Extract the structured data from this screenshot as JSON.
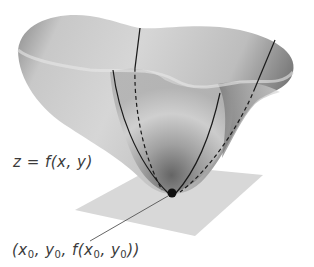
{
  "figure": {
    "surface_label": "z = f(x, y)",
    "point_label": {
      "open": "(",
      "x": "x",
      "x_sub": "0",
      "sep1": ", ",
      "y": "y",
      "y_sub": "0",
      "sep2": ", f(",
      "fx": "x",
      "fx_sub": "0",
      "sep3": ", ",
      "fy": "y",
      "fy_sub": "0",
      "close": "))"
    },
    "colors": {
      "surface_light": "#e6e6e6",
      "surface_mid": "#b5b5b5",
      "surface_dark": "#6e6e6e",
      "plane": "#d9d9d9",
      "curve": "#1a1a1a",
      "point": "#111111",
      "text": "#3a3a3a"
    }
  }
}
